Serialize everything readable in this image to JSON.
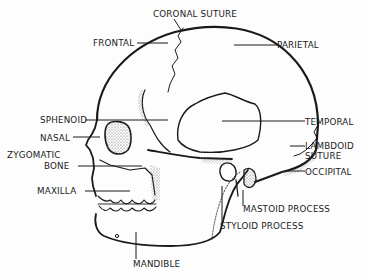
{
  "diagram": {
    "ink_color": "#1a1a1a",
    "shade_color": "#7a7a7a",
    "labels": [
      {
        "id": "coronal-suture",
        "text": "CORONAL SUTURE",
        "x": 153,
        "y": 9
      },
      {
        "id": "frontal",
        "text": "FRONTAL",
        "x": 93,
        "y": 38
      },
      {
        "id": "parietal",
        "text": "PARIETAL",
        "x": 277,
        "y": 40
      },
      {
        "id": "sphenoid",
        "text": "SPHENOID",
        "x": 40,
        "y": 115
      },
      {
        "id": "temporal",
        "text": "TEMPORAL",
        "x": 305,
        "y": 117
      },
      {
        "id": "nasal",
        "text": "NASAL",
        "x": 40,
        "y": 133
      },
      {
        "id": "lambdoid-suture-line1",
        "text": "LAMBDOID",
        "x": 305,
        "y": 141
      },
      {
        "id": "zygomatic-bone-line1",
        "text": "ZYGOMATIC",
        "x": 7,
        "y": 150
      },
      {
        "id": "lambdoid-suture-line2",
        "text": "SUTURE",
        "x": 305,
        "y": 151
      },
      {
        "id": "zygomatic-bone-line2",
        "text": "BONE",
        "x": 44,
        "y": 161
      },
      {
        "id": "occipital",
        "text": "OCCIPITAL",
        "x": 305,
        "y": 167
      },
      {
        "id": "maxilla",
        "text": "MAXILLA",
        "x": 37,
        "y": 186
      },
      {
        "id": "mastoid-process",
        "text": "MASTOID PROCESS",
        "x": 243,
        "y": 204
      },
      {
        "id": "styloid-process",
        "text": "STYLOID PROCESS",
        "x": 220,
        "y": 221
      },
      {
        "id": "mandible",
        "text": "MANDIBLE",
        "x": 133,
        "y": 259
      }
    ]
  }
}
